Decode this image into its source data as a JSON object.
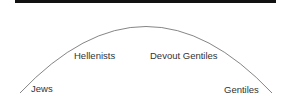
{
  "diagram": {
    "type": "arc-spectrum",
    "labels": {
      "left_end": "Jews",
      "left_mid": "Hellenists",
      "right_mid": "Devout Gentiles",
      "right_end": "Gentiles"
    },
    "colors": {
      "bar": "#111111",
      "arc": "#666666",
      "text": "#333333"
    }
  }
}
